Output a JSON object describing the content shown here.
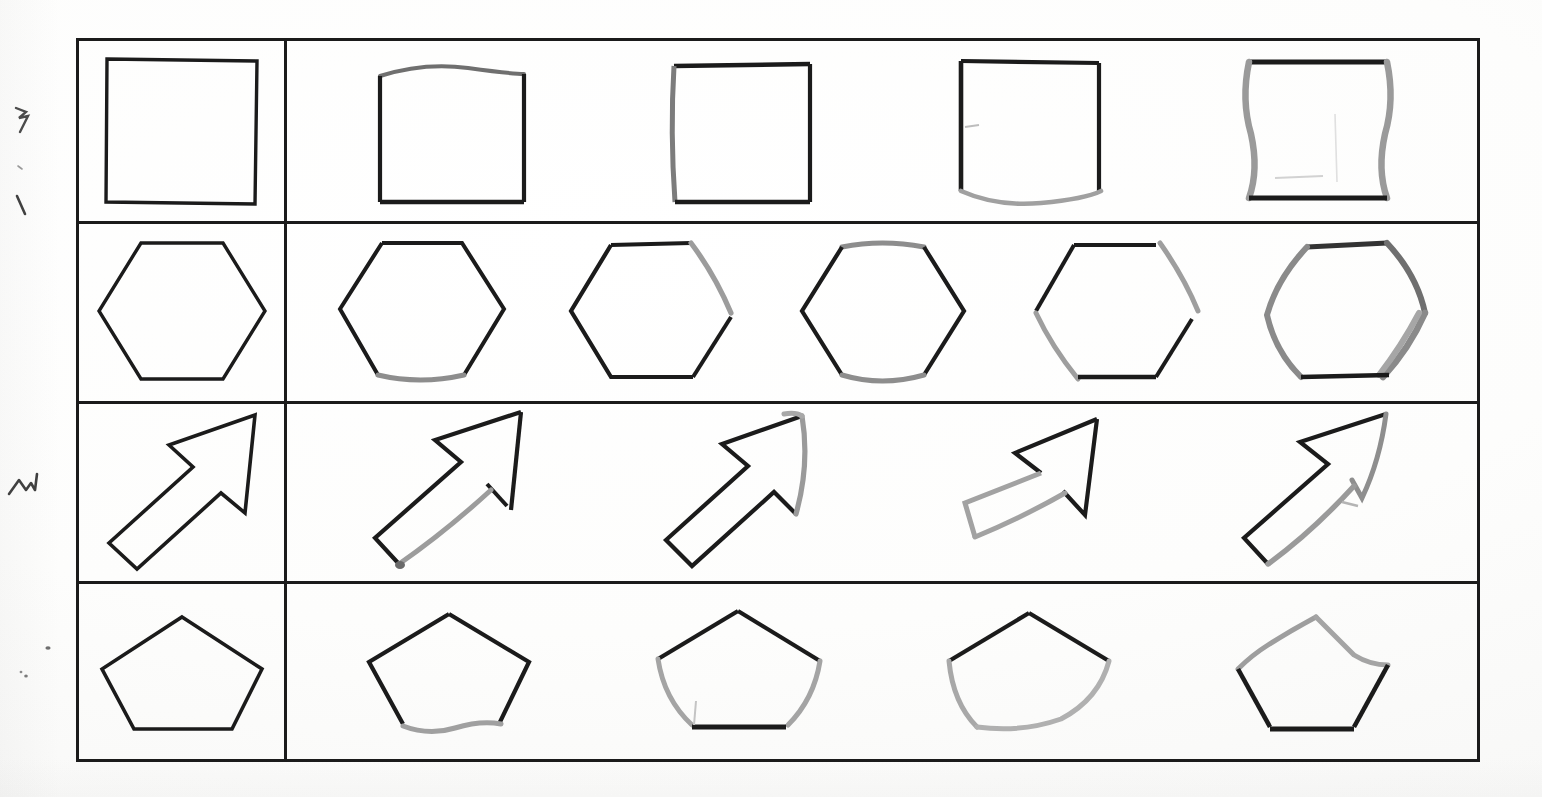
{
  "document": {
    "kind": "scanned-worksheet",
    "title": "Shape copying worksheet",
    "paper_color": "#fdfdfc",
    "ink_color": "#1b1b1b",
    "pencil_color": "#8e8e8e",
    "rule_color": "#1b1b1b",
    "rows": 4,
    "reference_column_count": 1,
    "attempt_column_count": 5
  },
  "table": {
    "left": 76,
    "top": 38,
    "width": 1404,
    "height": 724,
    "border_width": 3,
    "column_divider_x": 205,
    "row_divider_y": [
      180,
      360,
      540
    ],
    "row_heights": [
      180,
      180,
      180,
      184
    ]
  },
  "rows": [
    {
      "index": 0,
      "shape_name": "square",
      "reference_label": "square-reference",
      "attempts": [
        {
          "id": "square-attempt-1",
          "quality": "clean",
          "note": "top edge slightly bowed, all four sides closed"
        },
        {
          "id": "square-attempt-2",
          "quality": "clean",
          "note": "left side drawn with grey pencil, corners sharp"
        },
        {
          "id": "square-attempt-3",
          "quality": "faded",
          "note": "bottom edge faint grey and bowed downward"
        },
        {
          "id": "square-attempt-4",
          "quality": "faded",
          "note": "left and right sides wavy grey, top and bottom dark"
        }
      ]
    },
    {
      "index": 1,
      "shape_name": "hexagon",
      "reference_label": "hexagon-reference",
      "attempts": [
        {
          "id": "hexagon-attempt-1",
          "quality": "clean",
          "note": "bottom edge partly grey"
        },
        {
          "id": "hexagon-attempt-2",
          "quality": "partial",
          "note": "upper-right edge faint grey, small gap"
        },
        {
          "id": "hexagon-attempt-3",
          "quality": "faded",
          "note": "top and bottom edges grey"
        },
        {
          "id": "hexagon-attempt-4",
          "quality": "broken",
          "note": "right edge grey with gap, lower-left edge grey"
        },
        {
          "id": "hexagon-attempt-5",
          "quality": "overdrawn",
          "note": "right side drawn twice, heavy grey doubling"
        }
      ]
    },
    {
      "index": 2,
      "shape_name": "arrow",
      "reference_label": "arrow-reference",
      "attempts": [
        {
          "id": "arrow-attempt-1",
          "quality": "partial",
          "note": "lower shaft edge grey and broken"
        },
        {
          "id": "arrow-attempt-2",
          "quality": "faded",
          "note": "right head edge faint grey"
        },
        {
          "id": "arrow-attempt-3",
          "quality": "faded",
          "note": "whole lower body grey, shaft short"
        },
        {
          "id": "arrow-attempt-4",
          "quality": "faded",
          "note": "right shaft edge grey, head outline dark"
        }
      ]
    },
    {
      "index": 3,
      "shape_name": "pentagon",
      "reference_label": "pentagon-reference",
      "attempts": [
        {
          "id": "pentagon-attempt-1",
          "quality": "faded",
          "note": "bottom edge wavy grey"
        },
        {
          "id": "pentagon-attempt-2",
          "quality": "faded",
          "note": "left and right lower edges grey, bottom dark"
        },
        {
          "id": "pentagon-attempt-3",
          "quality": "faded",
          "note": "bottom and both lower edges grey, open look"
        },
        {
          "id": "pentagon-attempt-4",
          "quality": "faded",
          "note": "upper edges grey, lower edges dark"
        }
      ]
    }
  ],
  "margin_marks": [
    {
      "id": "stray-mark-1",
      "x": 14,
      "y": 112,
      "glyph": "zigzag-small"
    },
    {
      "id": "stray-mark-2",
      "x": 18,
      "y": 168,
      "glyph": "dot-small"
    },
    {
      "id": "stray-mark-3",
      "x": 16,
      "y": 200,
      "glyph": "tick-small"
    },
    {
      "id": "stray-mark-4",
      "x": 10,
      "y": 480,
      "glyph": "zigzag-wide"
    },
    {
      "id": "stray-mark-5",
      "x": 44,
      "y": 648,
      "glyph": "dot-small"
    },
    {
      "id": "stray-mark-6",
      "x": 20,
      "y": 672,
      "glyph": "dot-small"
    }
  ]
}
